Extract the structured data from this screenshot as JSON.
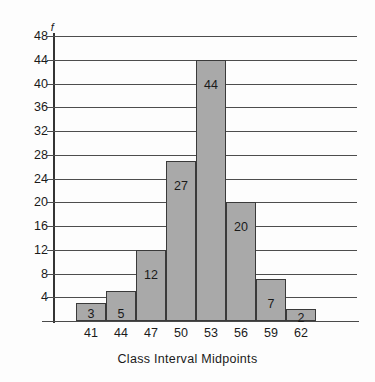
{
  "chart_data": {
    "type": "bar",
    "title": "",
    "subtitle": "",
    "xlabel": "Class Interval Midpoints",
    "ylabel": "f",
    "categories": [
      "41",
      "44",
      "47",
      "50",
      "53",
      "56",
      "59",
      "62"
    ],
    "values": [
      3,
      5,
      12,
      27,
      44,
      20,
      7,
      2
    ],
    "bar_labels": [
      "3",
      "5",
      "12",
      "27",
      "44",
      "20",
      "7",
      "2"
    ],
    "series": [
      {
        "name": "f",
        "values": [
          3,
          5,
          12,
          27,
          44,
          20,
          7,
          2
        ]
      }
    ],
    "ylim": [
      0,
      48
    ],
    "y_tick_values": [
      4,
      8,
      12,
      16,
      20,
      24,
      28,
      32,
      36,
      40,
      44,
      48
    ],
    "y_tick_labels": [
      "4",
      "8",
      "12",
      "16",
      "20",
      "24",
      "28",
      "32",
      "36",
      "40",
      "44",
      "48"
    ],
    "y_tick_step": 4,
    "grid": true,
    "grid_axis": "y",
    "legend": false,
    "legend_position": "none",
    "bar_fill_color": "#a9a9a9",
    "bar_border_color": "#3a3a3a",
    "grid_color": "#4d4d4d",
    "axis_color": "#343434",
    "background_color": "#fdfdfd",
    "text_color": "#1a1a1a"
  }
}
